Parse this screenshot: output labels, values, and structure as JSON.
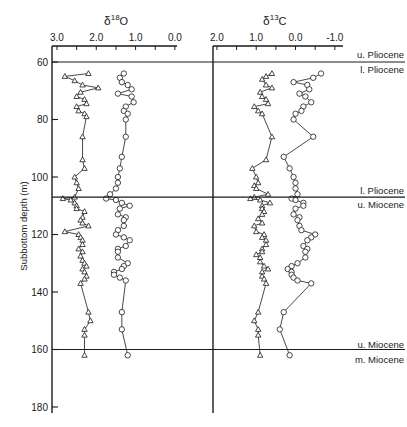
{
  "chart_data": {
    "type": "line",
    "title": "",
    "ylabel": "Subbottom depth (m)",
    "ylim": [
      180,
      55
    ],
    "yticks": [
      60,
      80,
      100,
      120,
      140,
      160,
      180
    ],
    "panels": [
      {
        "name": "d18O",
        "title_main": "δ",
        "title_sup": "18",
        "title_elem": "O",
        "xlim": [
          3.1,
          -0.05
        ],
        "xticks": [
          3.0,
          2.5,
          2.0,
          1.5,
          1.0,
          0.5,
          0.0
        ],
        "xtick_labels": [
          "3.0",
          "",
          "2.0",
          "",
          "1.0",
          "",
          "0.0"
        ],
        "series": [
          {
            "name": "planktonic (triangles)",
            "marker": "triangle",
            "points": [
              [
                64,
                2.2
              ],
              [
                65,
                2.8
              ],
              [
                66.5,
                2.55
              ],
              [
                68,
                2.35
              ],
              [
                69,
                1.95
              ],
              [
                70.5,
                2.4
              ],
              [
                72,
                2.5
              ],
              [
                73,
                2.3
              ],
              [
                74.5,
                2.25
              ],
              [
                75.5,
                2.5
              ],
              [
                77,
                2.45
              ],
              [
                78,
                2.3
              ],
              [
                79,
                2.25
              ],
              [
                86,
                2.35
              ],
              [
                94,
                2.35
              ],
              [
                97,
                2.3
              ],
              [
                100,
                2.55
              ],
              [
                102,
                2.5
              ],
              [
                104,
                2.45
              ],
              [
                107,
                2.55
              ],
              [
                107.5,
                2.85
              ],
              [
                108,
                2.65
              ],
              [
                109,
                2.55
              ],
              [
                110,
                2.5
              ],
              [
                111,
                2.5
              ],
              [
                112,
                2.3
              ],
              [
                114,
                2.35
              ],
              [
                115,
                2.4
              ],
              [
                116,
                2.35
              ],
              [
                117,
                2.2
              ],
              [
                119,
                2.8
              ],
              [
                120,
                2.45
              ],
              [
                121,
                2.4
              ],
              [
                122,
                2.35
              ],
              [
                123.5,
                2.35
              ],
              [
                125,
                2.45
              ],
              [
                126,
                2.35
              ],
              [
                127.5,
                2.4
              ],
              [
                129,
                2.35
              ],
              [
                130,
                2.3
              ],
              [
                131,
                2.25
              ],
              [
                132,
                2.35
              ],
              [
                133,
                2.3
              ],
              [
                134.5,
                2.25
              ],
              [
                135.5,
                2.3
              ],
              [
                137,
                2.4
              ],
              [
                147,
                2.2
              ],
              [
                150,
                2.15
              ],
              [
                153,
                2.3
              ],
              [
                155,
                2.3
              ],
              [
                162,
                2.3
              ]
            ]
          },
          {
            "name": "benthic (circles)",
            "marker": "circle",
            "points": [
              [
                64,
                1.3
              ],
              [
                65.5,
                1.4
              ],
              [
                67,
                1.35
              ],
              [
                68,
                1.2
              ],
              [
                69.5,
                1.1
              ],
              [
                71,
                1.45
              ],
              [
                72,
                1.1
              ],
              [
                74,
                1.05
              ],
              [
                75.5,
                1.25
              ],
              [
                77,
                1.3
              ],
              [
                78,
                1.2
              ],
              [
                80,
                1.25
              ],
              [
                86,
                1.25
              ],
              [
                93,
                1.35
              ],
              [
                97,
                1.4
              ],
              [
                100,
                1.45
              ],
              [
                102,
                1.45
              ],
              [
                104,
                1.5
              ],
              [
                106,
                1.65
              ],
              [
                107.5,
                1.75
              ],
              [
                108,
                1.5
              ],
              [
                109,
                1.35
              ],
              [
                110,
                1.15
              ],
              [
                111,
                1.4
              ],
              [
                113,
                1.45
              ],
              [
                114,
                1.25
              ],
              [
                115,
                1.3
              ],
              [
                117,
                1.3
              ],
              [
                118.5,
                1.45
              ],
              [
                120,
                1.5
              ],
              [
                121,
                1.3
              ],
              [
                122,
                1.15
              ],
              [
                124,
                1.25
              ],
              [
                125,
                1.45
              ],
              [
                126,
                1.45
              ],
              [
                128,
                1.45
              ],
              [
                130,
                1.2
              ],
              [
                131,
                1.3
              ],
              [
                132,
                1.35
              ],
              [
                133,
                1.55
              ],
              [
                134,
                1.55
              ],
              [
                135,
                1.4
              ],
              [
                136,
                1.25
              ],
              [
                147,
                1.35
              ],
              [
                153,
                1.35
              ],
              [
                162,
                1.2
              ]
            ]
          }
        ]
      },
      {
        "name": "d13C",
        "title_main": "δ",
        "title_sup": "13",
        "title_elem": "C",
        "xlim": [
          2.1,
          -1.05
        ],
        "xticks": [
          2.0,
          1.5,
          1.0,
          0.5,
          0.0,
          -0.5,
          -1.0
        ],
        "xtick_labels": [
          "2.0",
          "",
          "1.0",
          "",
          "0.0",
          "",
          "-1.0"
        ],
        "series": [
          {
            "name": "planktonic (triangles)",
            "marker": "triangle",
            "points": [
              [
                64,
                0.6
              ],
              [
                65,
                0.75
              ],
              [
                66,
                0.85
              ],
              [
                68,
                0.75
              ],
              [
                69,
                0.6
              ],
              [
                70.5,
                0.9
              ],
              [
                72,
                0.85
              ],
              [
                73,
                0.75
              ],
              [
                74.5,
                0.7
              ],
              [
                75.5,
                1.05
              ],
              [
                77,
                0.95
              ],
              [
                78,
                0.85
              ],
              [
                86,
                0.6
              ],
              [
                94,
                0.75
              ],
              [
                97,
                1.1
              ],
              [
                100,
                1.0
              ],
              [
                102,
                0.95
              ],
              [
                103,
                1.05
              ],
              [
                104,
                1.0
              ],
              [
                106,
                0.7
              ],
              [
                107,
                1.05
              ],
              [
                107.5,
                1.15
              ],
              [
                108,
                0.9
              ],
              [
                109,
                0.65
              ],
              [
                110,
                0.85
              ],
              [
                111,
                0.85
              ],
              [
                112,
                0.8
              ],
              [
                113,
                0.85
              ],
              [
                114.5,
                0.95
              ],
              [
                116,
                0.85
              ],
              [
                117,
                1.05
              ],
              [
                119,
                1.0
              ],
              [
                120,
                0.8
              ],
              [
                121,
                0.85
              ],
              [
                122,
                0.75
              ],
              [
                123.5,
                0.75
              ],
              [
                125,
                0.85
              ],
              [
                126,
                0.85
              ],
              [
                127,
                1.0
              ],
              [
                128,
                0.9
              ],
              [
                129.5,
                0.9
              ],
              [
                131,
                0.8
              ],
              [
                132,
                0.7
              ],
              [
                133,
                0.85
              ],
              [
                134.5,
                0.85
              ],
              [
                135.5,
                0.8
              ],
              [
                137,
                0.75
              ],
              [
                147,
                0.95
              ],
              [
                150,
                1.05
              ],
              [
                153,
                0.95
              ],
              [
                155,
                0.95
              ],
              [
                162,
                0.9
              ]
            ]
          },
          {
            "name": "benthic (circles)",
            "marker": "circle",
            "points": [
              [
                64,
                -0.65
              ],
              [
                65.5,
                -0.45
              ],
              [
                67,
                0.05
              ],
              [
                68,
                -0.3
              ],
              [
                69.5,
                -0.35
              ],
              [
                71,
                -0.1
              ],
              [
                72,
                -0.25
              ],
              [
                74,
                -0.4
              ],
              [
                75.5,
                -0.2
              ],
              [
                77,
                -0.15
              ],
              [
                78,
                0.0
              ],
              [
                80,
                0.05
              ],
              [
                86,
                -0.45
              ],
              [
                93,
                0.3
              ],
              [
                97,
                0.15
              ],
              [
                100,
                0.05
              ],
              [
                102,
                0.0
              ],
              [
                104,
                0.0
              ],
              [
                106,
                -0.05
              ],
              [
                107.5,
                0.1
              ],
              [
                108,
                0.0
              ],
              [
                109,
                -0.2
              ],
              [
                110,
                -0.2
              ],
              [
                111,
                0.0
              ],
              [
                113,
                0.05
              ],
              [
                114,
                -0.1
              ],
              [
                115,
                -0.05
              ],
              [
                117,
                -0.1
              ],
              [
                118.5,
                -0.15
              ],
              [
                120,
                -0.5
              ],
              [
                121,
                -0.4
              ],
              [
                122,
                -0.3
              ],
              [
                124,
                -0.2
              ],
              [
                125,
                -0.3
              ],
              [
                126,
                -0.25
              ],
              [
                128,
                -0.25
              ],
              [
                130,
                -0.05
              ],
              [
                131,
                0.1
              ],
              [
                132,
                0.2
              ],
              [
                133,
                0.1
              ],
              [
                134,
                0.1
              ],
              [
                135,
                0.05
              ],
              [
                136,
                -0.05
              ],
              [
                137,
                -0.4
              ],
              [
                147,
                0.3
              ],
              [
                153,
                0.4
              ],
              [
                162,
                0.15
              ]
            ]
          }
        ]
      }
    ],
    "boundaries": [
      {
        "depth": 60,
        "above": "u. Pliocene",
        "below": "l. Pliocene"
      },
      {
        "depth": 107,
        "above": "l. Pliocene",
        "below": "u. Miocene"
      },
      {
        "depth": 160,
        "above": "u. Miocene",
        "below": "m. Miocene"
      }
    ]
  },
  "labels": {
    "y_axis_title": "Subbottom depth (m)",
    "boundary_60_above": "u. Pliocene",
    "boundary_60_below": "l. Pliocene",
    "boundary_107_above": "l. Pliocene",
    "boundary_107_below": "u. Miocene",
    "boundary_160_above": "u. Miocene",
    "boundary_160_below": "m. Miocene"
  },
  "colors": {
    "ink": "#1a1a1a",
    "background": "#ffffff"
  }
}
